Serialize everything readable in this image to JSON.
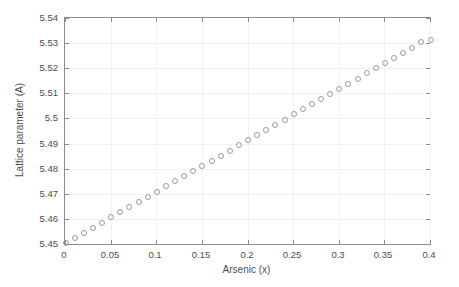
{
  "chart_data": {
    "type": "scatter",
    "title": "",
    "xlabel": "Arsenic (x)",
    "ylabel": "Lattice  parameter (A)",
    "xlim": [
      0,
      0.4
    ],
    "ylim": [
      5.45,
      5.54
    ],
    "xticks": [
      "0",
      "0.05",
      "0.1",
      "0.15",
      "0.2",
      "0.25",
      "0.3",
      "0.35",
      "0.4"
    ],
    "xtick_values": [
      0,
      0.05,
      0.1,
      0.15,
      0.2,
      0.25,
      0.3,
      0.35,
      0.4
    ],
    "yticks": [
      "5.45",
      "5.46",
      "5.47",
      "5.48",
      "5.49",
      "5.5",
      "5.51",
      "5.52",
      "5.53",
      "5.54"
    ],
    "ytick_values": [
      5.45,
      5.46,
      5.47,
      5.48,
      5.49,
      5.5,
      5.51,
      5.52,
      5.53,
      5.54
    ],
    "grid": true,
    "legend": null,
    "marker_style": "open-circle",
    "marker_color": "#9a9a9a",
    "axis_color": "#8c8c8c",
    "grid_color": "#f0f0f0",
    "x": [
      0,
      0.01,
      0.02,
      0.03,
      0.04,
      0.05,
      0.06,
      0.07,
      0.08,
      0.09,
      0.1,
      0.11,
      0.12,
      0.13,
      0.14,
      0.15,
      0.16,
      0.17,
      0.18,
      0.19,
      0.2,
      0.21,
      0.22,
      0.23,
      0.24,
      0.25,
      0.26,
      0.27,
      0.28,
      0.29,
      0.3,
      0.31,
      0.32,
      0.33,
      0.34,
      0.35,
      0.36,
      0.37,
      0.38,
      0.39,
      0.4
    ],
    "y": [
      5.4505,
      5.4526,
      5.4546,
      5.4567,
      5.4587,
      5.4608,
      5.4628,
      5.4649,
      5.4669,
      5.469,
      5.471,
      5.4731,
      5.4751,
      5.4772,
      5.4792,
      5.4813,
      5.4833,
      5.4854,
      5.4874,
      5.4895,
      5.4915,
      5.4936,
      5.4956,
      5.4977,
      5.4997,
      5.5018,
      5.5038,
      5.5059,
      5.5079,
      5.51,
      5.512,
      5.5141,
      5.5161,
      5.5182,
      5.5202,
      5.5223,
      5.5243,
      5.5264,
      5.5284,
      5.5305,
      5.5315
    ]
  }
}
